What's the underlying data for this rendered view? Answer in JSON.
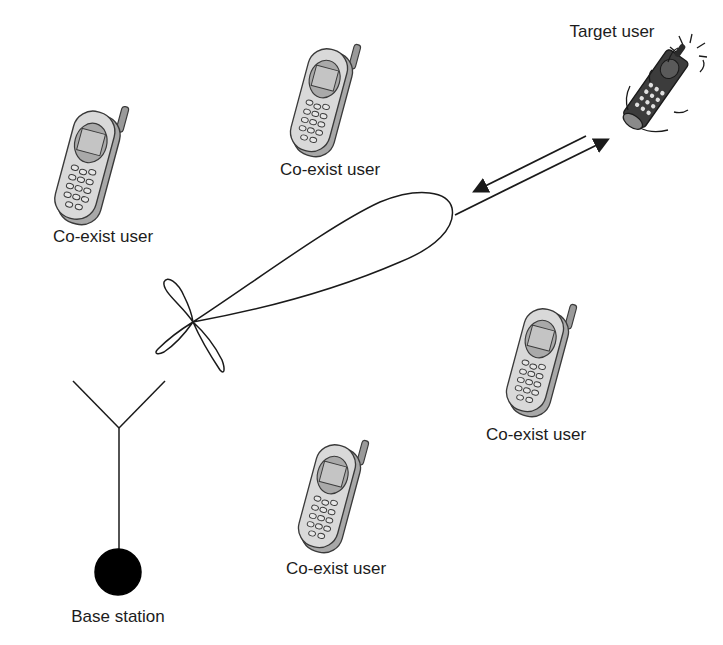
{
  "diagram": {
    "type": "beamforming-illustration",
    "colors": {
      "line": "#1a1a1a",
      "phone_body": "#d9d9d9",
      "phone_outline": "#3a3a3a",
      "phone_screen": "#bdbdbd",
      "target_phone_body": "#3c3c3c",
      "base_station_fill": "#000000",
      "text": "#1c1c1c"
    },
    "base_station": {
      "label": "Base station",
      "antenna_apex": [
        119,
        428
      ],
      "node_center": [
        118,
        572
      ],
      "node_radius": 23
    },
    "beam": {
      "origin": [
        193,
        322
      ],
      "main_lobe_tip": [
        452,
        215
      ],
      "side_lobes": 3
    },
    "link_arrows": {
      "downlink": {
        "from": [
          455,
          215
        ],
        "to": [
          608,
          139
        ]
      },
      "uplink": {
        "from": [
          586,
          136
        ],
        "to": [
          474,
          192
        ]
      }
    },
    "target_user": {
      "label": "Target user",
      "position": [
        655,
        85
      ]
    },
    "coexist_users": [
      {
        "label": "Co-exist user",
        "position": [
          88,
          165
        ],
        "label_pos": [
          103,
          230
        ]
      },
      {
        "label": "Co-exist user",
        "position": [
          322,
          100
        ],
        "label_pos": [
          330,
          161
        ]
      },
      {
        "label": "Co-exist user",
        "position": [
          538,
          360
        ],
        "label_pos": [
          536,
          426
        ]
      },
      {
        "label": "Co-exist user",
        "position": [
          330,
          496
        ],
        "label_pos": [
          336,
          560
        ]
      }
    ]
  }
}
